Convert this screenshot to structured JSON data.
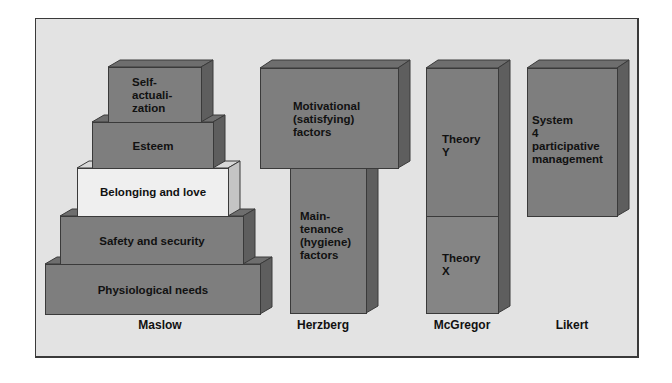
{
  "diagram": {
    "colors": {
      "background": "#e3e3e3",
      "box_front": "#7e7e7e",
      "box_side": "#5e5e5e",
      "box_top": "#6e6e6e",
      "highlight_front": "#efefef",
      "highlight_side": "#c4c4c4",
      "text": "#111111",
      "border": "#3a3a3a"
    },
    "columns": [
      {
        "name": "Maslow",
        "blocks": [
          {
            "label": "Self-\nactuali-\nzation",
            "lines": [
              "Self-",
              "actuali-",
              "zation"
            ]
          },
          {
            "label": "Esteem"
          },
          {
            "label": "Belonging and love",
            "highlighted": true
          },
          {
            "label": "Safety and security"
          },
          {
            "label": "Physiological needs"
          }
        ]
      },
      {
        "name": "Herzberg",
        "blocks": [
          {
            "label": "Motivational (satisfying) factors",
            "lines": [
              "Motivational",
              "(satisfying)",
              "factors"
            ]
          },
          {
            "label": "Main-tenance (hygiene) factors",
            "lines": [
              "Main-",
              "tenance",
              "(hygiene)",
              "factors"
            ]
          }
        ]
      },
      {
        "name": "McGregor",
        "blocks": [
          {
            "label": "Theory Y",
            "lines": [
              "Theory",
              "Y"
            ]
          },
          {
            "label": "Theory X",
            "lines": [
              "Theory",
              "X"
            ]
          }
        ]
      },
      {
        "name": "Likert",
        "blocks": [
          {
            "label": "System 4 participative management",
            "lines": [
              "System",
              "4",
              "participative",
              "management"
            ]
          }
        ]
      }
    ]
  }
}
